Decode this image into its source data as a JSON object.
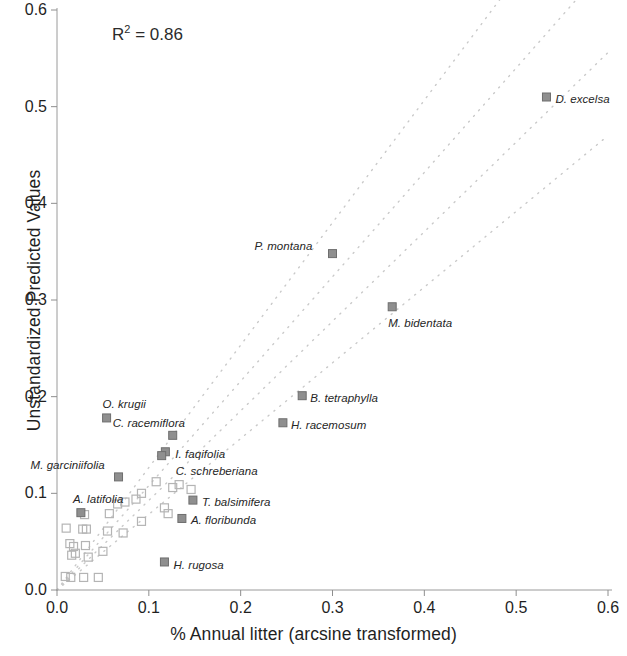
{
  "chart_data": {
    "type": "scatter",
    "title": "",
    "xlabel": "% Annual litter (arcsine transformed)",
    "ylabel": "Unstandardized Predicted Values",
    "xlim": [
      0.0,
      0.6
    ],
    "ylim": [
      0.0,
      0.6
    ],
    "xticks": [
      "0.0",
      "0.1",
      "0.2",
      "0.3",
      "0.4",
      "0.5",
      "0.6"
    ],
    "yticks": [
      "0.0",
      "0.1",
      "0.2",
      "0.3",
      "0.4",
      "0.5",
      "0.6"
    ],
    "xtick_values": [
      0.0,
      0.1,
      0.2,
      0.3,
      0.4,
      0.5,
      0.6
    ],
    "ytick_values": [
      0.0,
      0.1,
      0.2,
      0.3,
      0.4,
      0.5,
      0.6
    ],
    "grid": false,
    "legend": "none",
    "annotations": [
      {
        "text": "R² = 0.86",
        "base": "R",
        "sup": "2",
        "rest": " = 0.86",
        "x": 0.06,
        "y": 0.585
      }
    ],
    "marker_styles": {
      "labeled": {
        "name": "filled-square",
        "fill": "#8f8f8f",
        "stroke": "#6e6e6e",
        "size": 8
      },
      "unlabeled": {
        "name": "open-square",
        "fill": "none",
        "stroke": "#b4b4b4",
        "size": 8
      }
    },
    "reference_lines": {
      "style": "dotted",
      "color": "#c9c9c9",
      "count": 4,
      "description": "Four parallel dotted regression / confidence band lines fanning out from near the origin",
      "lines": [
        {
          "name": "band-upper-outer",
          "x1": 0.0,
          "y1": 0.0,
          "x2": 0.6,
          "y2": 0.76
        },
        {
          "name": "band-upper-inner",
          "x1": 0.0,
          "y1": 0.0,
          "x2": 0.6,
          "y2": 0.648
        },
        {
          "name": "regression-line",
          "x1": 0.0,
          "y1": 0.0,
          "x2": 0.6,
          "y2": 0.556
        },
        {
          "name": "band-lower-outer",
          "x1": 0.0,
          "y1": 0.0,
          "x2": 0.6,
          "y2": 0.47
        }
      ]
    },
    "labeled_points": [
      {
        "label": "D. excelsa",
        "x": 0.533,
        "y": 0.51,
        "label_dx": 9,
        "label_dy": 4
      },
      {
        "label": "P. montana",
        "x": 0.3,
        "y": 0.348,
        "label_dx": -78,
        "label_dy": -6
      },
      {
        "label": "M. bidentata",
        "x": 0.365,
        "y": 0.293,
        "label_dx": -4,
        "label_dy": 18
      },
      {
        "label": "B. tetraphylla",
        "x": 0.267,
        "y": 0.201,
        "label_dx": 8,
        "label_dy": 4
      },
      {
        "label": "H. racemosum",
        "x": 0.246,
        "y": 0.173,
        "label_dx": 8,
        "label_dy": 4
      },
      {
        "label": "O. krugii",
        "x": 0.054,
        "y": 0.178,
        "label_dx": -4,
        "label_dy": -12
      },
      {
        "label": "C. racemiflora",
        "x": 0.126,
        "y": 0.16,
        "label_dx": -60,
        "label_dy": -10
      },
      {
        "label": "I. faqifolia",
        "x": 0.118,
        "y": 0.143,
        "label_dx": 10,
        "label_dy": 4
      },
      {
        "label": "C. schreberiana",
        "x": 0.114,
        "y": 0.139,
        "label_dx": 14,
        "label_dy": 17
      },
      {
        "label": "M. garciniifolia",
        "x": 0.067,
        "y": 0.117,
        "label_dx": -88,
        "label_dy": -10
      },
      {
        "label": "T. balsimifera",
        "x": 0.148,
        "y": 0.093,
        "label_dx": 9,
        "label_dy": 4
      },
      {
        "label": "A. latifolia",
        "x": 0.026,
        "y": 0.08,
        "label_dx": -8,
        "label_dy": -12
      },
      {
        "label": "A. floribunda",
        "x": 0.136,
        "y": 0.074,
        "label_dx": 9,
        "label_dy": 4
      },
      {
        "label": "H. rugosa",
        "x": 0.117,
        "y": 0.029,
        "label_dx": 9,
        "label_dy": 5
      }
    ],
    "unlabeled_points": [
      {
        "x": 0.108,
        "y": 0.112
      },
      {
        "x": 0.126,
        "y": 0.106
      },
      {
        "x": 0.133,
        "y": 0.109
      },
      {
        "x": 0.146,
        "y": 0.104
      },
      {
        "x": 0.092,
        "y": 0.1
      },
      {
        "x": 0.086,
        "y": 0.094
      },
      {
        "x": 0.074,
        "y": 0.091
      },
      {
        "x": 0.066,
        "y": 0.089
      },
      {
        "x": 0.117,
        "y": 0.085
      },
      {
        "x": 0.121,
        "y": 0.079
      },
      {
        "x": 0.057,
        "y": 0.079
      },
      {
        "x": 0.03,
        "y": 0.078
      },
      {
        "x": 0.092,
        "y": 0.071
      },
      {
        "x": 0.01,
        "y": 0.064
      },
      {
        "x": 0.028,
        "y": 0.063
      },
      {
        "x": 0.032,
        "y": 0.063
      },
      {
        "x": 0.055,
        "y": 0.061
      },
      {
        "x": 0.072,
        "y": 0.059
      },
      {
        "x": 0.014,
        "y": 0.048
      },
      {
        "x": 0.018,
        "y": 0.045
      },
      {
        "x": 0.031,
        "y": 0.046
      },
      {
        "x": 0.02,
        "y": 0.038
      },
      {
        "x": 0.05,
        "y": 0.04
      },
      {
        "x": 0.016,
        "y": 0.036
      },
      {
        "x": 0.034,
        "y": 0.034
      },
      {
        "x": 0.009,
        "y": 0.014
      },
      {
        "x": 0.015,
        "y": 0.013
      },
      {
        "x": 0.029,
        "y": 0.013
      },
      {
        "x": 0.045,
        "y": 0.013
      }
    ]
  }
}
